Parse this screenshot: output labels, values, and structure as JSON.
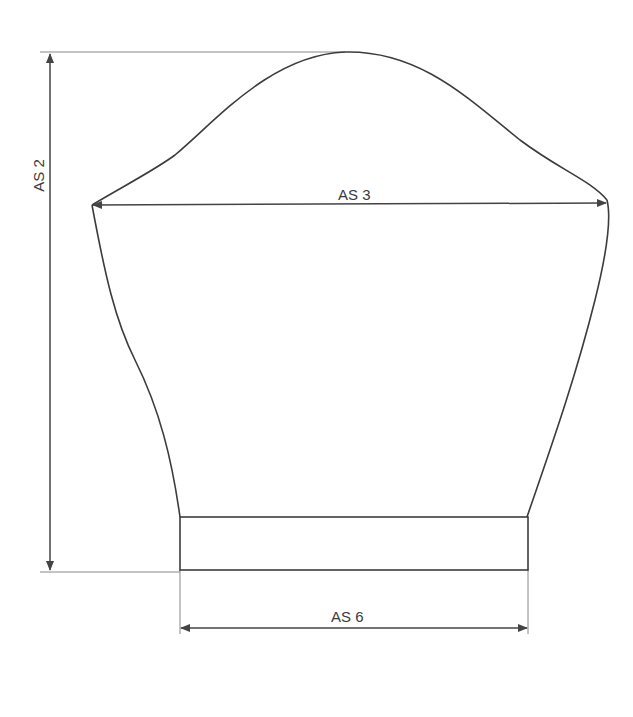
{
  "diagram": {
    "type": "knitting-sleeve-schematic",
    "colors": {
      "outline": "#3c3c3c",
      "dimension_line": "#444444",
      "extension_line": "#888888",
      "background": "#ffffff"
    },
    "dimensions": [
      {
        "id": "as2",
        "label": "AS 2",
        "orientation": "vertical",
        "description": "total sleeve length"
      },
      {
        "id": "as3",
        "label": "AS 3",
        "orientation": "horizontal",
        "description": "upper arm width"
      },
      {
        "id": "as6",
        "label": "AS 6",
        "orientation": "horizontal",
        "description": "cuff width"
      }
    ],
    "parts": [
      {
        "id": "sleeve-cap",
        "name": "Sleeve cap"
      },
      {
        "id": "sleeve-body",
        "name": "Sleeve body"
      },
      {
        "id": "cuff",
        "name": "Cuff band"
      }
    ]
  }
}
